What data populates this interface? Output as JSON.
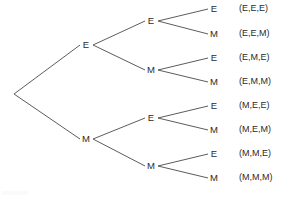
{
  "diagram": {
    "type": "probability-tree",
    "title": "",
    "background_color": "#ffffff",
    "line_color": "#4a4a4a",
    "text_color": "#2b2b2b",
    "root": {
      "label": "",
      "x": 14,
      "y": 94
    },
    "level1": [
      {
        "label": "E",
        "x": 86,
        "y": 45
      },
      {
        "label": "M",
        "x": 86,
        "y": 139
      }
    ],
    "level2": [
      {
        "label": "E",
        "x": 151,
        "y": 21,
        "parent": 0
      },
      {
        "label": "M",
        "x": 151,
        "y": 70,
        "parent": 0
      },
      {
        "label": "E",
        "x": 151,
        "y": 118,
        "parent": 1
      },
      {
        "label": "M",
        "x": 151,
        "y": 166,
        "parent": 1
      }
    ],
    "leaves": [
      {
        "label": "E",
        "outcome": "(E,E,E)",
        "x": 214,
        "y": 9,
        "parent": 0
      },
      {
        "label": "M",
        "outcome": "(E,E,M)",
        "x": 214,
        "y": 34,
        "parent": 0
      },
      {
        "label": "E",
        "outcome": "(E,M,E)",
        "x": 214,
        "y": 58,
        "parent": 1
      },
      {
        "label": "M",
        "outcome": "(E,M,M)",
        "x": 214,
        "y": 82,
        "parent": 1
      },
      {
        "label": "E",
        "outcome": "(M,E,E)",
        "x": 214,
        "y": 106,
        "parent": 2
      },
      {
        "label": "M",
        "outcome": "(M,E,M)",
        "x": 214,
        "y": 130,
        "parent": 2
      },
      {
        "label": "E",
        "outcome": "(M,M,E)",
        "x": 214,
        "y": 154,
        "parent": 3
      },
      {
        "label": "M",
        "outcome": "(M,M,M)",
        "x": 214,
        "y": 178,
        "parent": 3
      }
    ],
    "outcome_x": 239
  }
}
